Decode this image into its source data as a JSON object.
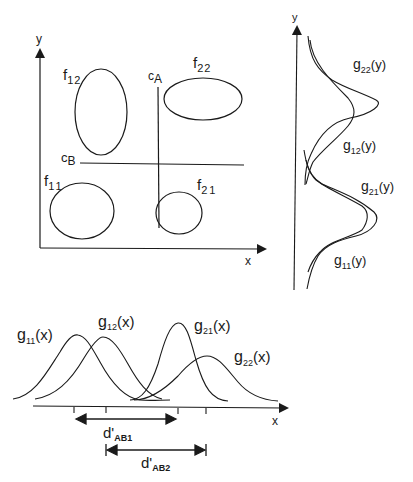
{
  "scatter_panel": {
    "x_axis_label": "x",
    "y_axis_label": "y",
    "clusters": [
      {
        "id": "f11",
        "base": "f",
        "sub": "11"
      },
      {
        "id": "f12",
        "base": "f",
        "sub": "12"
      },
      {
        "id": "f21",
        "base": "f",
        "sub": "21"
      },
      {
        "id": "f22",
        "base": "f",
        "sub": "22"
      }
    ],
    "criterion_a": {
      "base": "c",
      "sub": "A"
    },
    "criterion_b": {
      "base": "c",
      "sub": "B"
    }
  },
  "y_marginal_panel": {
    "axis_label": "y",
    "curves": [
      {
        "id": "g22y",
        "base": "g",
        "sub": "22",
        "arg": "(y)"
      },
      {
        "id": "g12y",
        "base": "g",
        "sub": "12",
        "arg": "(y)"
      },
      {
        "id": "g21y",
        "base": "g",
        "sub": "21",
        "arg": "(y)"
      },
      {
        "id": "g11y",
        "base": "g",
        "sub": "11",
        "arg": "(y)"
      }
    ]
  },
  "x_marginal_panel": {
    "axis_label": "x",
    "curves": [
      {
        "id": "g11x",
        "base": "g",
        "sub": "11",
        "arg": "(x)"
      },
      {
        "id": "g12x",
        "base": "g",
        "sub": "12",
        "arg": "(x)"
      },
      {
        "id": "g21x",
        "base": "g",
        "sub": "21",
        "arg": "(x)"
      },
      {
        "id": "g22x",
        "base": "g",
        "sub": "22",
        "arg": "(x)"
      }
    ],
    "distances": [
      {
        "id": "dAB1",
        "base": "d'",
        "sub": "AB1"
      },
      {
        "id": "dAB2",
        "base": "d'",
        "sub": "AB2"
      }
    ]
  },
  "colors": {
    "ink": "#1a1a1a",
    "background": "#ffffff"
  }
}
